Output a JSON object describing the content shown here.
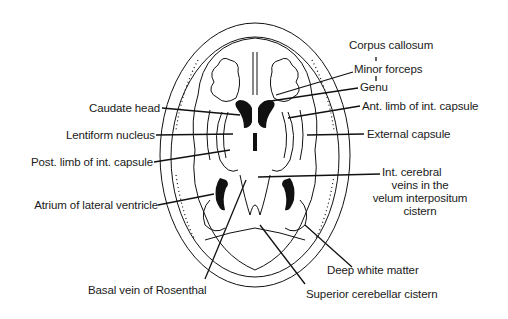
{
  "figure": {
    "labels": {
      "corpus_callosum": "Corpus callosum",
      "minor_forceps": "Minor forceps",
      "genu": "Genu",
      "ant_limb": "Ant. limb of int. capsule",
      "external_capsule": "External capsule",
      "caudate_head": "Caudate head",
      "lentiform": "Lentiform nucleus",
      "post_limb": "Post. limb of int. capsule",
      "atrium": "Atrium of lateral ventricle",
      "int_cerebral_1": "Int. cerebral",
      "int_cerebral_2": "veins in the",
      "int_cerebral_3": "velum interpositum",
      "int_cerebral_4": "cistern",
      "deep_white": "Deep white matter",
      "basal_vein": "Basal vein of Rosenthal",
      "sup_cerebellar": "Superior cerebellar cistern"
    },
    "colors": {
      "ink": "#111111",
      "background": "#ffffff"
    }
  }
}
